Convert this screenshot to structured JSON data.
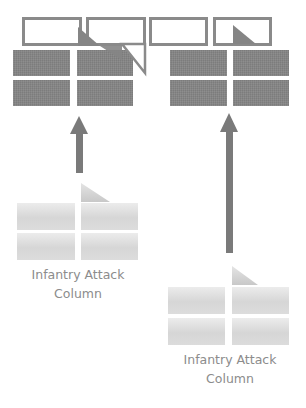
{
  "diagram": {
    "colors": {
      "line_block": "#858585",
      "outline": "#8a8a8a",
      "column_block_light": "#ececec",
      "column_block_dark": "#d6d6d6",
      "arrow": "#7a7a7a",
      "label_text": "#8c8c8c"
    },
    "defensive_line": {
      "outline_boxes": 4,
      "solid_block_groups": [
        {
          "position": "left",
          "rows": 2,
          "cols": 2
        },
        {
          "position": "right",
          "rows": 2,
          "cols": 2
        }
      ]
    },
    "arrows": [
      {
        "name": "left-advance-arrow",
        "direction": "up"
      },
      {
        "name": "right-advance-arrow",
        "direction": "up"
      }
    ],
    "columns": [
      {
        "label_line1": "Infantry Attack",
        "label_line2": "Column",
        "rows": 2,
        "cols": 2
      },
      {
        "label_line1": "Infantry Attack",
        "label_line2": "Column",
        "rows": 2,
        "cols": 2
      }
    ]
  }
}
